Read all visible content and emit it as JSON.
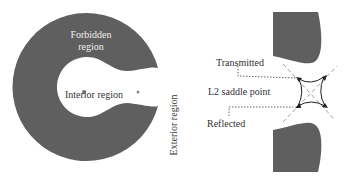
{
  "left_panel": {
    "forbidden_line1": "Forbidden",
    "forbidden_line2": "region",
    "interior": "Interior region",
    "exterior": "Exterior region"
  },
  "right_panel": {
    "transmitted": "Transmitted",
    "saddle": "L2 saddle point",
    "reflected": "Reflected"
  },
  "colors": {
    "region": "#5f5f5f",
    "text": "#333333",
    "background": "#ffffff"
  }
}
